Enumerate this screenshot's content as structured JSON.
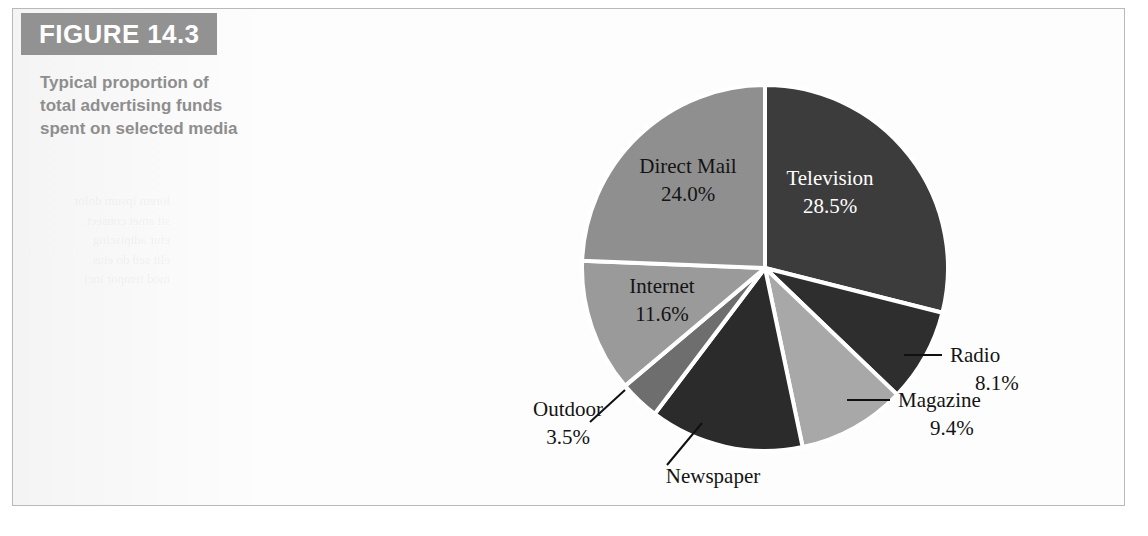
{
  "figure": {
    "number_label": "FIGURE 14.3",
    "caption": "Typical proportion of total advertising funds spent on selected media"
  },
  "colors": {
    "banner": "#929292",
    "caption_text": "#8e8e8e",
    "frame_border": "#b9b9b9",
    "page_background": "#ffffff",
    "slice_separator": "#ffffff"
  },
  "chart_data": {
    "type": "pie",
    "title": "Typical proportion of total advertising funds spent on selected media",
    "xlabel": "",
    "ylabel": "",
    "units": "percent",
    "start_angle_deg": 0,
    "direction": "clockwise",
    "legend_position": "none",
    "grid": false,
    "total": 98.5,
    "categories": [
      "Television",
      "Radio",
      "Magazine",
      "Newspaper",
      "Outdoor",
      "Internet",
      "Direct Mail"
    ],
    "values": [
      28.5,
      8.1,
      9.4,
      13.4,
      3.5,
      11.6,
      24.0
    ],
    "labels": [
      "Television\n28.5%",
      "Radio\n8.1%",
      "Magazine\n9.4%",
      "Newspaper\n13.4%",
      "Outdoor\n3.5%",
      "Internet\n11.6%",
      "Direct Mail\n24.0%"
    ],
    "slices": [
      {
        "name": "Television",
        "value": 28.5,
        "value_label": "28.5%",
        "color": "#3c3c3c",
        "label_style": "inside-light",
        "leader_line": false
      },
      {
        "name": "Radio",
        "value": 8.1,
        "value_label": "8.1%",
        "color": "#2e2e2e",
        "label_style": "outside-dark",
        "leader_line": true
      },
      {
        "name": "Magazine",
        "value": 9.4,
        "value_label": "9.4%",
        "color": "#a8a8a8",
        "label_style": "outside-dark",
        "leader_line": true
      },
      {
        "name": "Newspaper",
        "value": 13.4,
        "value_label": "13.4%",
        "color": "#2b2b2b",
        "label_style": "outside-dark",
        "leader_line": true
      },
      {
        "name": "Outdoor",
        "value": 3.5,
        "value_label": "3.5%",
        "color": "#6e6e6e",
        "label_style": "outside-dark",
        "leader_line": true
      },
      {
        "name": "Internet",
        "value": 11.6,
        "value_label": "11.6%",
        "color": "#9a9a9a",
        "label_style": "inside-dark",
        "leader_line": false
      },
      {
        "name": "Direct Mail",
        "value": 24.0,
        "value_label": "24.0%",
        "color": "#8f8f8f",
        "label_style": "inside-dark",
        "leader_line": false
      }
    ]
  },
  "labels": {
    "television_name": "Television",
    "television_value": "28.5%",
    "radio_name": "Radio",
    "radio_value": "8.1%",
    "magazine_name": "Magazine",
    "magazine_value": "9.4%",
    "newspaper_name": "Newspaper",
    "newspaper_value": "13.4%",
    "outdoor_name": "Outdoor",
    "outdoor_value": "3.5%",
    "internet_name": "Internet",
    "internet_value": "11.6%",
    "direct_mail_name": "Direct Mail",
    "direct_mail_value": "24.0%"
  }
}
